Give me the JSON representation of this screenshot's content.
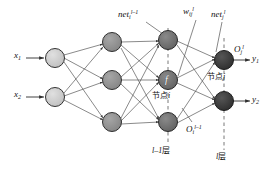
{
  "figure": {
    "background_color": "#ffffff",
    "line_color": "#3a3a3a",
    "text_color": "#111111"
  },
  "inputs": [
    {
      "name": "x1",
      "base": "x",
      "sub": "1"
    },
    {
      "name": "x2",
      "base": "x",
      "sub": "2"
    }
  ],
  "outputs": [
    {
      "name": "y1",
      "base": "y",
      "sub": "1"
    },
    {
      "name": "y2",
      "base": "y",
      "sub": "2"
    }
  ],
  "annotations": {
    "net_i_prev": {
      "base": "net",
      "sub": "i",
      "sup": "l–1"
    },
    "w_ij": {
      "base": "w",
      "sub": "ij",
      "sup": "l"
    },
    "net_j": {
      "base": "net",
      "sub": "j",
      "sup": "l"
    },
    "O_j": {
      "base": "O",
      "sub": "j",
      "sup": "l"
    },
    "O_i_prev": {
      "base": "O",
      "sub": "i",
      "sup": "l–1"
    }
  },
  "node_labels": {
    "node_i": {
      "cjk": "节点",
      "italic": "i"
    },
    "node_j": {
      "cjk": "节点",
      "italic": "j"
    },
    "activation_glyph": "f"
  },
  "layer_labels": {
    "layer_prev": {
      "italic": "l–1",
      "cjk": "层"
    },
    "layer_l": {
      "italic": "l",
      "cjk": "层"
    }
  },
  "layers": [
    {
      "id": "input-layer",
      "node_count": 2,
      "fill": "#c9c9c9",
      "stroke": "#333333",
      "x": 55,
      "radius": 9.5,
      "ys": [
        58,
        97
      ]
    },
    {
      "id": "hidden-layer-1",
      "node_count": 3,
      "fill": "#8f8f8f",
      "stroke": "#303030",
      "x": 112,
      "radius": 9.5,
      "ys": [
        42,
        80,
        122
      ]
    },
    {
      "id": "layer-l-minus-1",
      "node_count": 3,
      "fill": "#6e6e6e",
      "stroke": "#2a2a2a",
      "x": 168,
      "radius": 9.5,
      "ys": [
        40,
        80,
        122
      ]
    },
    {
      "id": "layer-l-output",
      "node_count": 2,
      "fill": "#3a3a3a",
      "stroke": "#1d1d1d",
      "x": 224,
      "radius": 9.5,
      "ys": [
        60,
        101
      ]
    }
  ],
  "dashed_guides": [
    {
      "name": "guide-layer-l-minus-1",
      "x": 168
    },
    {
      "name": "guide-layer-l",
      "x": 224
    }
  ]
}
